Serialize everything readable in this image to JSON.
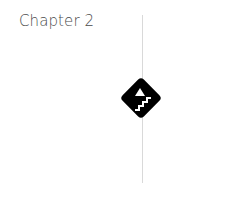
{
  "page": {
    "chapter_title": "Chapter 2"
  },
  "emblem": {
    "icon": "stairs-up-triangle-diamond-icon",
    "fill_color": "#000000",
    "glyph_color": "#ffffff"
  },
  "divider": {
    "color": "#d9d9d9"
  }
}
